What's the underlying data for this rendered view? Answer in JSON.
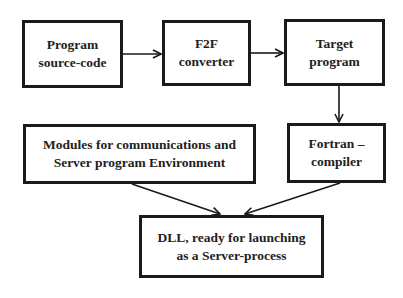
{
  "diagram": {
    "type": "flowchart",
    "nodes": [
      {
        "id": "source",
        "lines": [
          "Program",
          "source-code"
        ]
      },
      {
        "id": "converter",
        "lines": [
          "F2F",
          "converter"
        ]
      },
      {
        "id": "target",
        "lines": [
          "Target",
          "program"
        ]
      },
      {
        "id": "modules",
        "lines": [
          "Modules for communications and",
          "Server program Environment"
        ]
      },
      {
        "id": "compiler",
        "lines": [
          "Fortran –",
          "compiler"
        ]
      },
      {
        "id": "dll",
        "lines": [
          "DLL, ready for launching",
          "as a Server-process"
        ]
      }
    ],
    "edges": [
      {
        "from": "source",
        "to": "converter"
      },
      {
        "from": "converter",
        "to": "target"
      },
      {
        "from": "target",
        "to": "compiler"
      },
      {
        "from": "modules",
        "to": "dll"
      },
      {
        "from": "compiler",
        "to": "dll"
      }
    ],
    "colors": {
      "stroke": "#1a1a1a",
      "text": "#222222",
      "background": "#ffffff"
    }
  }
}
